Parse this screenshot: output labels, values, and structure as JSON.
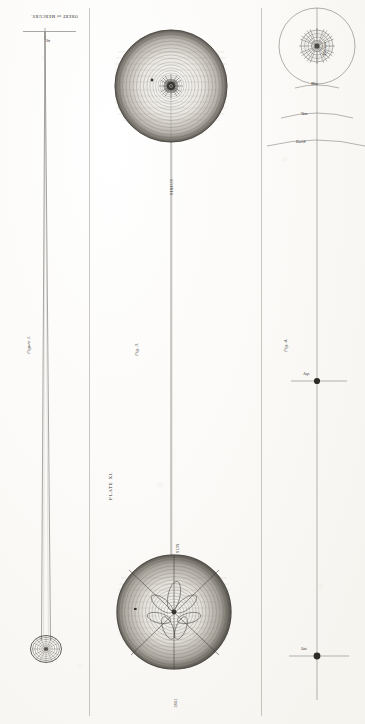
{
  "plate": {
    "title": "PLATE XI.",
    "sheet_note": "OBERT of MERCURY."
  },
  "figures": [
    {
      "id": "figure-1",
      "label": "Figure 1.",
      "top_label": "OBERT of MERCURY.",
      "axis_tick_label": "Sn",
      "description": "Narrow elongated cone tapering from a small ringed disc at bottom to a point at a horizontal datum line at top"
    },
    {
      "id": "figure-3",
      "label": "Fig. 3.",
      "upper_body": "SIRIUS",
      "lower_body": "THE SUN",
      "lower_body_label": "SUN",
      "bottom_label": "1861",
      "description": "Two large hatched spheres joined by a single long vertical line"
    },
    {
      "id": "figure-4",
      "label": "Fig. 4.",
      "top_body_label": "The Sun",
      "arc_labels": [
        "Mer.",
        "Ven.",
        "Earth"
      ],
      "node_labels": [
        "Jup.",
        "Sat."
      ],
      "description": "Sun disc with surrounding orbit circle, successive widening arcs below, then a long vertical line with two nodal dots"
    }
  ],
  "colors": {
    "ink": "#33312d",
    "line": "#55524c",
    "paper": "#fbfaf7",
    "rule": "#9d9a92"
  }
}
